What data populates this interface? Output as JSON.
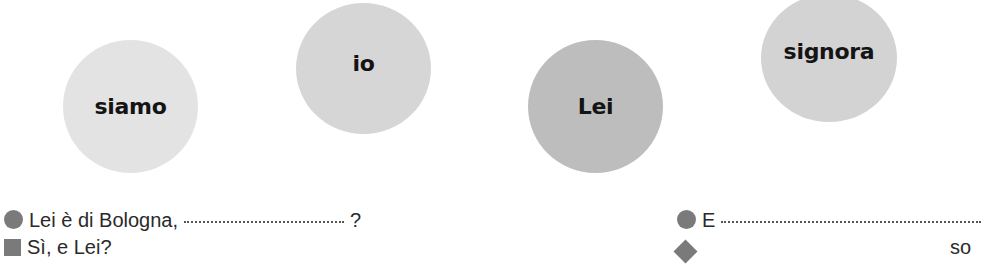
{
  "bubbles": [
    {
      "label": "siamo",
      "color": "#e3e3e3"
    },
    {
      "label": "io",
      "color": "#d6d6d6"
    },
    {
      "label": "Lei",
      "color": "#bdbdbd"
    },
    {
      "label": "signora",
      "color": "#d3d3d3"
    }
  ],
  "dialogue": {
    "left": [
      {
        "marker": "circle",
        "text": "Lei è di Bologna,",
        "blank": true,
        "after": "?"
      },
      {
        "marker": "square",
        "text": "Sì, e Lei?"
      }
    ],
    "right": [
      {
        "marker": "circle",
        "text": "E",
        "blank": true
      },
      {
        "marker": "diamond",
        "text": "",
        "partial_end": "so"
      }
    ]
  },
  "marker_color": "#7a7a7a"
}
